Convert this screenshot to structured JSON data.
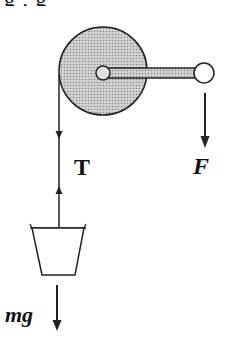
{
  "diagram": {
    "cropped_caption_fragment": "g        ,        g",
    "labels": {
      "tension": "T",
      "applied_force": "F",
      "weight": "mg"
    },
    "components": {
      "pulley": {
        "type": "disk",
        "fill": "#bdbdbd",
        "stroke": "#222222"
      },
      "hub": {
        "type": "axle",
        "fill": "#d9d9d9"
      },
      "handle_bar": {
        "type": "crank-arm",
        "fill": "#bdbdbd"
      },
      "handle_knob": {
        "type": "circle",
        "fill": "#ffffff"
      },
      "rope": {
        "type": "line"
      },
      "bucket": {
        "type": "trapezoid",
        "fill": "#ffffff"
      }
    },
    "arrows": [
      {
        "name": "tension-down-arrow",
        "direction": "down"
      },
      {
        "name": "tension-up-arrow",
        "direction": "up"
      },
      {
        "name": "force-arrow",
        "direction": "down",
        "label": "F"
      },
      {
        "name": "weight-arrow",
        "direction": "down",
        "label": "mg"
      }
    ]
  }
}
